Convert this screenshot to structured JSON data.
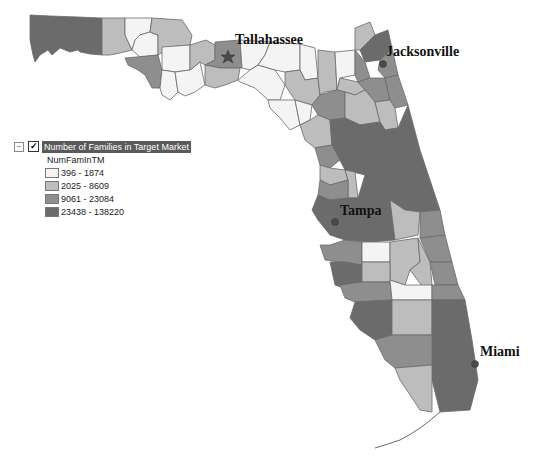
{
  "legend": {
    "expander_symbol": "−",
    "checkbox_symbol": "✓",
    "checked": true,
    "layer_title": "Number of Families in Target Market",
    "field_name": "NumFamInTM",
    "classes": [
      {
        "label": "396 - 1874",
        "color": "#f4f4f4"
      },
      {
        "label": "2025 - 8609",
        "color": "#bdbdbd"
      },
      {
        "label": "9061 - 23084",
        "color": "#8e8e8e"
      },
      {
        "label": "23438 - 138220",
        "color": "#6b6b6b"
      }
    ]
  },
  "cities": [
    {
      "name": "Tallahassee",
      "marker": "star-icon"
    },
    {
      "name": "Jacksonville",
      "marker": "dot-icon"
    },
    {
      "name": "Tampa",
      "marker": "dot-icon"
    },
    {
      "name": "Miami",
      "marker": "dot-icon"
    }
  ],
  "marker_color": "#5a5a5a",
  "outline_color": "#6a6a6a"
}
